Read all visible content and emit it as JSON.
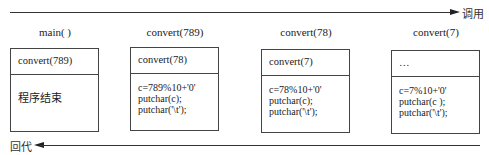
{
  "arrows": {
    "call": {
      "label": "调用",
      "direction": "right"
    },
    "return": {
      "label": "回代",
      "direction": "left"
    }
  },
  "frames": [
    {
      "title": "main( )",
      "top": "convert(789)",
      "body": [
        "程序结束"
      ]
    },
    {
      "title": "convert(789)",
      "top": "convert(78)",
      "body": [
        "c=789%10+'0'",
        "putchar(c);",
        "putchar('\\t');"
      ]
    },
    {
      "title": "convert(78)",
      "top": "convert(7)",
      "body": [
        "c=78%10+'0'",
        "putchar(c);",
        "putchar('\\t');"
      ]
    },
    {
      "title": "convert(7)",
      "top": "…",
      "body": [
        "c=7%10+'0'",
        "putchar(c );",
        "putchar('\\t');"
      ]
    }
  ],
  "colors": {
    "line": "#333333",
    "background": "#ffffff"
  }
}
